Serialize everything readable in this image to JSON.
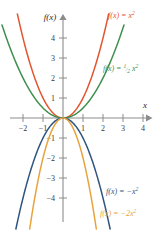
{
  "figure": {
    "background_color": "#ffffff",
    "axis_color": "#8c8c8c",
    "tick_text_color": "#3a3a3a",
    "x_axis_name": "x",
    "y_axis_name": "f(x)"
  },
  "chart_data": {
    "type": "line",
    "title": "",
    "xlabel": "x",
    "ylabel": "f(x)",
    "xlim": [
      -2.6,
      4.6
    ],
    "ylim": [
      -5.0,
      4.9
    ],
    "grid": false,
    "legend_position": "inline-curve-labels",
    "x_ticks": [
      -2,
      -1,
      1,
      2,
      3,
      4
    ],
    "x_tick_labels": [
      "−2",
      "−1",
      "1",
      "2",
      "3",
      "4"
    ],
    "y_ticks": [
      4,
      3,
      2,
      1,
      -1,
      -2,
      -3,
      -4
    ],
    "y_tick_labels": [
      "4",
      "3",
      "2",
      "1",
      "−1",
      "−2",
      "−3",
      "−4"
    ],
    "series": [
      {
        "name": "f(x) = x²",
        "equation": "y = x^2",
        "coefficient": 1,
        "color": "#e2552e",
        "label_base": "f(x) = x",
        "label_exponent": "2",
        "label_x": 108,
        "label_y": 18,
        "x": [
          -2.2,
          -2.0,
          -1.5,
          -1.0,
          -0.5,
          0,
          0.5,
          1.0,
          1.5,
          2.0,
          2.2
        ],
        "values": [
          4.84,
          4.0,
          2.25,
          1.0,
          0.25,
          0,
          0.25,
          1.0,
          2.25,
          4.0,
          4.84
        ]
      },
      {
        "name": "f(x) = ½ x²",
        "equation": "y = 0.5 x^2",
        "coefficient": 0.5,
        "color": "#3f8f4f",
        "label_base": "f(x) = ",
        "label_fraction_numerator": "1",
        "label_fraction_denominator": "2",
        "label_tail": "x",
        "label_exponent": "2",
        "label_x": 103,
        "label_y": 68,
        "x": [
          -3.1,
          -3.0,
          -2.5,
          -2.0,
          -1.5,
          -1.0,
          0,
          1.0,
          1.5,
          2.0,
          2.5,
          3.0,
          3.1
        ],
        "values": [
          4.8,
          4.5,
          3.125,
          2.0,
          1.125,
          0.5,
          0,
          0.5,
          1.125,
          2.0,
          3.125,
          4.5,
          4.8
        ]
      },
      {
        "name": "f(x) = −x²",
        "equation": "y = -x^2",
        "coefficient": -1,
        "color": "#2e5580",
        "label_base": "f(x) = −x",
        "label_exponent": "2",
        "label_x": 106,
        "label_y": 194,
        "x": [
          -2.2,
          -2.0,
          -1.5,
          -1.0,
          -0.5,
          0,
          0.5,
          1.0,
          1.5,
          2.0,
          2.2
        ],
        "values": [
          -4.84,
          -4.0,
          -2.25,
          -1.0,
          -0.25,
          0,
          -0.25,
          -1.0,
          -2.25,
          -4.0,
          -4.84
        ]
      },
      {
        "name": "f(x) = −2x²",
        "equation": "y = -2x^2",
        "coefficient": -2,
        "color": "#e8a33d",
        "label_base": "f(x) = −2x",
        "label_exponent": "2",
        "label_x": 100,
        "label_y": 216,
        "x": [
          -1.58,
          -1.5,
          -1.25,
          -1.0,
          -0.75,
          -0.5,
          0,
          0.5,
          0.75,
          1.0,
          1.25,
          1.5,
          1.58
        ],
        "values": [
          -5.0,
          -4.5,
          -3.125,
          -2.0,
          -1.125,
          -0.5,
          0,
          -0.5,
          -1.125,
          -2.0,
          -3.125,
          -4.5,
          -5.0
        ]
      }
    ]
  }
}
